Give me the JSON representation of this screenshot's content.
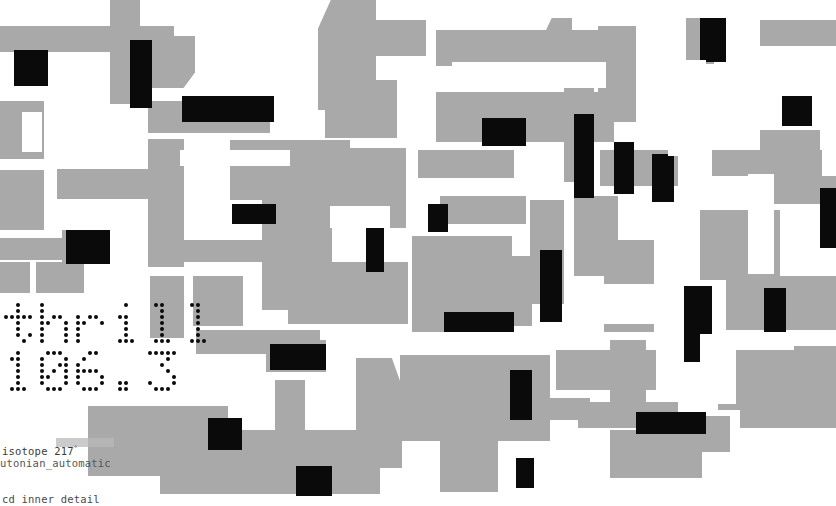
{
  "image": {
    "title": "cd inner detail",
    "width": 836,
    "height": 506,
    "palette": {
      "background": "#ffffff",
      "gray": "#a9a9a9",
      "black": "#0a0a0a",
      "caption_text": "#3b3b3b"
    }
  },
  "display": {
    "line1": "thrill",
    "line2": "106.3",
    "dot_color": "#0a0a0a",
    "panel_color": "#ffffff"
  },
  "captions": {
    "line1": "isotope 217",
    "line1_superscript": "°",
    "line2": "utonian_automatic",
    "bottom": "cd inner detail"
  },
  "blocks": {
    "gray": [
      [
        0,
        26,
        62,
        26
      ],
      [
        62,
        26,
        112,
        26
      ],
      [
        0,
        101,
        44,
        58
      ],
      [
        0,
        170,
        44,
        60
      ],
      [
        57,
        169,
        110,
        30
      ],
      [
        0,
        238,
        96,
        22
      ],
      [
        0,
        262,
        30,
        66
      ],
      [
        36,
        262,
        44,
        66
      ],
      [
        0,
        340,
        104,
        22
      ],
      [
        0,
        372,
        70,
        22
      ],
      [
        62,
        230,
        22,
        70
      ],
      [
        110,
        0,
        30,
        104
      ],
      [
        143,
        36,
        52,
        52
      ],
      [
        148,
        101,
        122,
        32
      ],
      [
        148,
        139,
        36,
        128
      ],
      [
        150,
        240,
        126,
        22
      ],
      [
        150,
        276,
        34,
        62
      ],
      [
        193,
        276,
        50,
        50
      ],
      [
        88,
        406,
        140,
        70
      ],
      [
        196,
        330,
        124,
        24
      ],
      [
        160,
        430,
        220,
        64
      ],
      [
        230,
        140,
        120,
        60
      ],
      [
        262,
        200,
        70,
        110
      ],
      [
        288,
        262,
        120,
        62
      ],
      [
        266,
        340,
        60,
        32
      ],
      [
        275,
        380,
        30,
        110
      ],
      [
        318,
        0,
        58,
        110
      ],
      [
        330,
        20,
        96,
        36
      ],
      [
        325,
        80,
        72,
        58
      ],
      [
        310,
        148,
        96,
        80
      ],
      [
        356,
        358,
        46,
        110
      ],
      [
        400,
        355,
        150,
        86
      ],
      [
        412,
        236,
        100,
        96
      ],
      [
        436,
        30,
        170,
        36
      ],
      [
        436,
        92,
        178,
        50
      ],
      [
        418,
        150,
        96,
        28
      ],
      [
        432,
        256,
        100,
        70
      ],
      [
        440,
        196,
        86,
        28
      ],
      [
        440,
        436,
        58,
        56
      ],
      [
        470,
        398,
        120,
        22
      ],
      [
        530,
        200,
        34,
        104
      ],
      [
        546,
        18,
        26,
        46
      ],
      [
        564,
        72,
        30,
        110
      ],
      [
        574,
        196,
        44,
        80
      ],
      [
        598,
        26,
        38,
        96
      ],
      [
        600,
        150,
        78,
        36
      ],
      [
        604,
        240,
        50,
        92
      ],
      [
        610,
        340,
        36,
        70
      ],
      [
        578,
        402,
        100,
        26
      ],
      [
        610,
        430,
        92,
        48
      ],
      [
        640,
        416,
        90,
        36
      ],
      [
        556,
        350,
        100,
        40
      ],
      [
        686,
        18,
        28,
        46
      ],
      [
        700,
        210,
        80,
        70
      ],
      [
        712,
        150,
        110,
        26
      ],
      [
        726,
        276,
        110,
        54
      ],
      [
        760,
        20,
        46,
        26
      ],
      [
        806,
        20,
        30,
        26
      ],
      [
        718,
        350,
        80,
        60
      ],
      [
        740,
        402,
        96,
        26
      ],
      [
        760,
        130,
        60,
        26
      ],
      [
        770,
        176,
        66,
        28
      ],
      [
        794,
        346,
        42,
        60
      ]
    ],
    "black": [
      [
        14,
        50,
        34,
        36
      ],
      [
        66,
        230,
        44,
        34
      ],
      [
        16,
        324,
        118,
        14
      ],
      [
        130,
        40,
        22,
        68
      ],
      [
        182,
        96,
        92,
        26
      ],
      [
        232,
        204,
        44,
        20
      ],
      [
        270,
        344,
        56,
        26
      ],
      [
        208,
        418,
        34,
        32
      ],
      [
        296,
        466,
        36,
        30
      ],
      [
        366,
        208,
        18,
        64
      ],
      [
        428,
        204,
        20,
        28
      ],
      [
        444,
        312,
        70,
        20
      ],
      [
        482,
        118,
        44,
        28
      ],
      [
        510,
        370,
        22,
        50
      ],
      [
        516,
        458,
        18,
        30
      ],
      [
        540,
        250,
        22,
        72
      ],
      [
        574,
        114,
        20,
        84
      ],
      [
        614,
        142,
        20,
        52
      ],
      [
        652,
        154,
        22,
        48
      ],
      [
        636,
        412,
        70,
        22
      ],
      [
        684,
        286,
        28,
        76
      ],
      [
        700,
        18,
        26,
        44
      ],
      [
        764,
        288,
        22,
        44
      ],
      [
        782,
        96,
        30,
        30
      ],
      [
        820,
        188,
        16,
        60
      ]
    ],
    "white": [
      [
        22,
        112,
        20,
        40
      ],
      [
        180,
        150,
        110,
        16
      ],
      [
        330,
        206,
        60,
        22
      ],
      [
        452,
        62,
        154,
        26
      ],
      [
        592,
        284,
        86,
        40
      ],
      [
        668,
        60,
        38,
        96
      ],
      [
        700,
        334,
        36,
        70
      ],
      [
        748,
        174,
        26,
        100
      ]
    ]
  }
}
